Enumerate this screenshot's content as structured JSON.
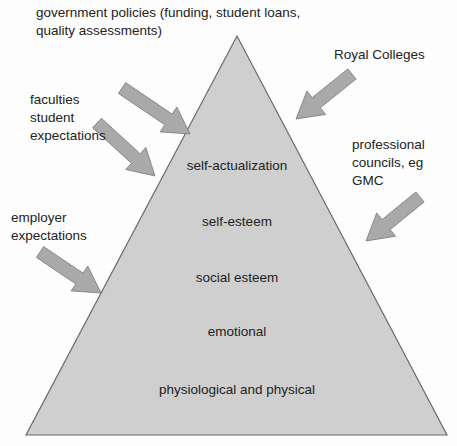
{
  "diagram": {
    "type": "pyramid-with-external-influences",
    "pyramid_tiers_top_to_bottom": [
      "self-actualization",
      "self-esteem",
      "social esteem",
      "emotional",
      "physiological and physical"
    ],
    "influences": [
      {
        "id": "government",
        "lines": [
          "government policies (funding, student loans,",
          "quality assessments)"
        ]
      },
      {
        "id": "royal-colleges",
        "lines": [
          "Royal Colleges"
        ]
      },
      {
        "id": "faculties",
        "lines": [
          "faculties",
          "student",
          "expectations"
        ]
      },
      {
        "id": "professional-councils",
        "lines": [
          "professional",
          "councils, eg",
          "GMC"
        ]
      },
      {
        "id": "employer",
        "lines": [
          "employer",
          "expectations"
        ]
      }
    ],
    "colors": {
      "pyramid_fill": "#cfcfcf",
      "pyramid_stroke": "#6b6b6b",
      "arrow_fill": "#a9a9a9",
      "arrow_stroke": "#7a7a7a"
    }
  }
}
